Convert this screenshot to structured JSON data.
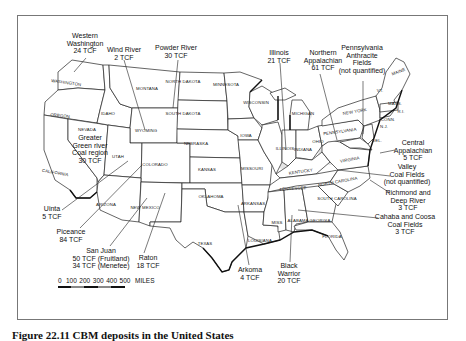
{
  "figure": {
    "caption": "Figure 22.11  CBM deposits in the United States"
  },
  "scale_bar": {
    "ticks": [
      "0",
      "100",
      "200",
      "300",
      "400",
      "500"
    ],
    "unit": "MILES"
  },
  "states": [
    {
      "name": "WASHINGTON",
      "x": 66,
      "y": 84,
      "rot": 8
    },
    {
      "name": "OREGON",
      "x": 60,
      "y": 117,
      "rot": 6
    },
    {
      "name": "CALIFORNIA",
      "x": 55,
      "y": 174,
      "rot": 10
    },
    {
      "name": "NEVADA",
      "x": 87,
      "y": 131,
      "rot": 0
    },
    {
      "name": "IDAHO",
      "x": 108,
      "y": 115,
      "rot": 0
    },
    {
      "name": "MONTANA",
      "x": 147,
      "y": 90,
      "rot": 0
    },
    {
      "name": "WYOMING",
      "x": 146,
      "y": 132,
      "rot": 0
    },
    {
      "name": "UTAH",
      "x": 118,
      "y": 158,
      "rot": 0
    },
    {
      "name": "COLORADO",
      "x": 155,
      "y": 166,
      "rot": 0
    },
    {
      "name": "ARIZONA",
      "x": 106,
      "y": 206,
      "rot": 0
    },
    {
      "name": "NEW MEXICO",
      "x": 145,
      "y": 209,
      "rot": 0
    },
    {
      "name": "NORTH DAKOTA",
      "x": 183,
      "y": 83,
      "rot": 0
    },
    {
      "name": "SOUTH DAKOTA",
      "x": 183,
      "y": 115,
      "rot": 0
    },
    {
      "name": "NEBRASKA",
      "x": 196,
      "y": 145,
      "rot": 0
    },
    {
      "name": "KANSAS",
      "x": 207,
      "y": 171,
      "rot": 0
    },
    {
      "name": "OKLAHOMA",
      "x": 211,
      "y": 198,
      "rot": 0
    },
    {
      "name": "TEXAS",
      "x": 205,
      "y": 245,
      "rot": 0
    },
    {
      "name": "MINNESOTA",
      "x": 226,
      "y": 86,
      "rot": 0
    },
    {
      "name": "IOWA",
      "x": 246,
      "y": 137,
      "rot": 0
    },
    {
      "name": "MISSOURI",
      "x": 252,
      "y": 170,
      "rot": 0
    },
    {
      "name": "ARKANSAS",
      "x": 253,
      "y": 205,
      "rot": 0
    },
    {
      "name": "LOUISIANA",
      "x": 260,
      "y": 242,
      "rot": 0
    },
    {
      "name": "WISCONSIN",
      "x": 256,
      "y": 104,
      "rot": 0
    },
    {
      "name": "ILLINOIS",
      "x": 285,
      "y": 150,
      "rot": 0
    },
    {
      "name": "MICHIGAN",
      "x": 303,
      "y": 115,
      "rot": 0
    },
    {
      "name": "INDIANA",
      "x": 303,
      "y": 151,
      "rot": 0
    },
    {
      "name": "OHIO",
      "x": 318,
      "y": 143,
      "rot": 0
    },
    {
      "name": "KENTUCKY",
      "x": 301,
      "y": 173,
      "rot": -8
    },
    {
      "name": "TENNESSEE",
      "x": 293,
      "y": 190,
      "rot": -4
    },
    {
      "name": "MISS",
      "x": 277,
      "y": 224,
      "rot": 0
    },
    {
      "name": "ALABAMA",
      "x": 298,
      "y": 222,
      "rot": 0
    },
    {
      "name": "GEORGIA",
      "x": 320,
      "y": 222,
      "rot": 0
    },
    {
      "name": "FLORIDA",
      "x": 332,
      "y": 238,
      "rot": 0
    },
    {
      "name": "SOUTH CAROLINA",
      "x": 337,
      "y": 200,
      "rot": 0
    },
    {
      "name": "NORTH CAROLINA",
      "x": 338,
      "y": 183,
      "rot": -10
    },
    {
      "name": "VIRGINIA",
      "x": 350,
      "y": 161,
      "rot": -10
    },
    {
      "name": "PENNSYLVANIA",
      "x": 340,
      "y": 133,
      "rot": -8
    },
    {
      "name": "NEW YORK",
      "x": 355,
      "y": 113,
      "rot": -10
    },
    {
      "name": "DEL.",
      "x": 377,
      "y": 142,
      "rot": 0
    },
    {
      "name": "N.J.",
      "x": 384,
      "y": 128,
      "rot": 0
    },
    {
      "name": "CONN.",
      "x": 388,
      "y": 121,
      "rot": 0
    },
    {
      "name": "R.I.",
      "x": 401,
      "y": 113,
      "rot": 0
    },
    {
      "name": "MASS.",
      "x": 395,
      "y": 105,
      "rot": 0
    },
    {
      "name": "VT.",
      "x": 380,
      "y": 92,
      "rot": 0
    },
    {
      "name": "MAINE",
      "x": 399,
      "y": 73,
      "rot": -20
    }
  ],
  "basins": [
    {
      "name": "western-washington",
      "lines": [
        "Western",
        "Washington",
        "24 TCF"
      ],
      "x": 85,
      "y": 38,
      "leader": [
        [
          86,
          58
        ],
        [
          74,
          72
        ]
      ]
    },
    {
      "name": "wind-river",
      "lines": [
        "Wind River",
        "2 TCF"
      ],
      "x": 124,
      "y": 52,
      "leader": [
        [
          124,
          60
        ],
        [
          145,
          130
        ]
      ]
    },
    {
      "name": "powder-river",
      "lines": [
        "Powder River",
        "30 TCF"
      ],
      "x": 176,
      "y": 50,
      "leader": [
        [
          178,
          60
        ],
        [
          173,
          108
        ]
      ]
    },
    {
      "name": "illinois",
      "lines": [
        "Illinois",
        "21 TCF"
      ],
      "x": 279,
      "y": 55,
      "leader": [
        [
          280,
          63
        ],
        [
          286,
          150
        ]
      ]
    },
    {
      "name": "northern-appalachian",
      "lines": [
        "Northern",
        "Appalachian",
        "61 TCF"
      ],
      "x": 323,
      "y": 55,
      "leader": [
        [
          320,
          74
        ],
        [
          337,
          140
        ]
      ]
    },
    {
      "name": "pennsylvania-anthracite",
      "lines": [
        "Pennsylvania",
        "Anthracite",
        "Fields",
        "(not quantified)"
      ],
      "x": 362,
      "y": 50,
      "leader": [
        [
          363,
          81
        ],
        [
          363,
          134
        ]
      ]
    },
    {
      "name": "greater-green-river",
      "lines": [
        "Greater",
        "Green river",
        "Coal region",
        "30 TCF"
      ],
      "x": 90,
      "y": 140,
      "leader": null
    },
    {
      "name": "central-appalachian",
      "lines": [
        "Central",
        "Appalachian",
        "5 TCF"
      ],
      "x": 413,
      "y": 145,
      "leader": [
        [
          395,
          150
        ],
        [
          380,
          153
        ]
      ]
    },
    {
      "name": "valley-coal-fields",
      "lines": [
        "Valley",
        "Coal Fields",
        "(not quantified)"
      ],
      "x": 407,
      "y": 169,
      "leader": [
        [
          390,
          176
        ],
        [
          338,
          170
        ]
      ]
    },
    {
      "name": "richmond-deep-river",
      "lines": [
        "Richmond and",
        "Deep River",
        "3 TCF"
      ],
      "x": 408,
      "y": 195,
      "leader": [
        [
          390,
          193
        ],
        [
          370,
          180
        ]
      ]
    },
    {
      "name": "cahaba-coosa",
      "lines": [
        "Cahaba and Coosa",
        "Coal Fields",
        "3 TCF"
      ],
      "x": 405,
      "y": 219,
      "leader": [
        [
          378,
          218
        ],
        [
          298,
          210
        ]
      ]
    },
    {
      "name": "uinta",
      "lines": [
        "Uinta",
        "5 TCF"
      ],
      "x": 52,
      "y": 211,
      "leader": [
        [
          62,
          210
        ],
        [
          128,
          161
        ]
      ]
    },
    {
      "name": "piceance",
      "lines": [
        "Piceance",
        "84 TCF"
      ],
      "x": 71,
      "y": 234,
      "leader": [
        [
          80,
          228
        ],
        [
          142,
          165
        ]
      ]
    },
    {
      "name": "san-juan",
      "lines": [
        "San Juan",
        "50 TCF (Fruitland)",
        "34 TCF (Menefee)"
      ],
      "x": 101,
      "y": 253,
      "leader": [
        [
          110,
          246
        ],
        [
          147,
          198
        ]
      ]
    },
    {
      "name": "raton",
      "lines": [
        "Raton",
        "18 TCF"
      ],
      "x": 148,
      "y": 260,
      "leader": [
        [
          144,
          253
        ],
        [
          165,
          193
        ]
      ]
    },
    {
      "name": "arkoma",
      "lines": [
        "Arkoma",
        "4 TCF"
      ],
      "x": 250,
      "y": 272,
      "leader": [
        [
          249,
          265
        ],
        [
          238,
          205
        ]
      ]
    },
    {
      "name": "black-warrior",
      "lines": [
        "Black",
        "Warrior",
        "20 TCF"
      ],
      "x": 289,
      "y": 268,
      "leader": [
        [
          290,
          262
        ],
        [
          292,
          215
        ]
      ]
    }
  ]
}
